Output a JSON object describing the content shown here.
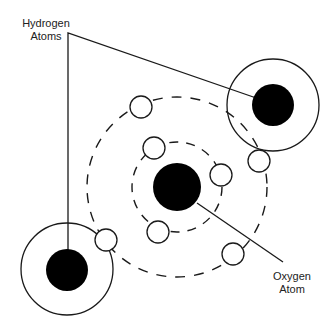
{
  "labels": {
    "hydrogen": {
      "line1": "Hydrogen",
      "line2": "Atoms"
    },
    "oxygen": {
      "line1": "Oxygen",
      "line2": "Atom"
    }
  },
  "colors": {
    "stroke": "#1a1a1a",
    "nucleus_fill": "#000000",
    "electron_fill": "#ffffff",
    "background": "#ffffff"
  },
  "diagram": {
    "oxygen": {
      "nucleus": {
        "cx": 177,
        "cy": 187,
        "r": 24
      },
      "inner_orbit": {
        "cx": 177,
        "cy": 187,
        "r": 45
      },
      "outer_orbit": {
        "cx": 177,
        "cy": 187,
        "r": 90
      },
      "inner_electrons": [
        {
          "cx": 154,
          "cy": 148,
          "r": 11
        },
        {
          "cx": 221,
          "cy": 175,
          "r": 11
        },
        {
          "cx": 158,
          "cy": 232,
          "r": 11
        }
      ],
      "outer_electrons": [
        {
          "cx": 141,
          "cy": 107,
          "r": 11
        },
        {
          "cx": 259,
          "cy": 161,
          "r": 11
        },
        {
          "cx": 233,
          "cy": 254,
          "r": 11
        },
        {
          "cx": 106,
          "cy": 240,
          "r": 11
        }
      ]
    },
    "hydrogens": [
      {
        "shell": {
          "cx": 273,
          "cy": 105,
          "r": 46
        },
        "nucleus": {
          "cx": 273,
          "cy": 105,
          "r": 21
        }
      },
      {
        "shell": {
          "cx": 67,
          "cy": 269,
          "r": 46
        },
        "nucleus": {
          "cx": 67,
          "cy": 270,
          "r": 21
        }
      }
    ],
    "leader_lines": {
      "hydrogen": {
        "corner": [
          68,
          33
        ],
        "to_top_right": [
          262,
          100
        ],
        "to_bottom_left": [
          68,
          252
        ]
      },
      "oxygen": {
        "from": [
          197,
          203
        ],
        "to": [
          283,
          262
        ]
      }
    }
  }
}
